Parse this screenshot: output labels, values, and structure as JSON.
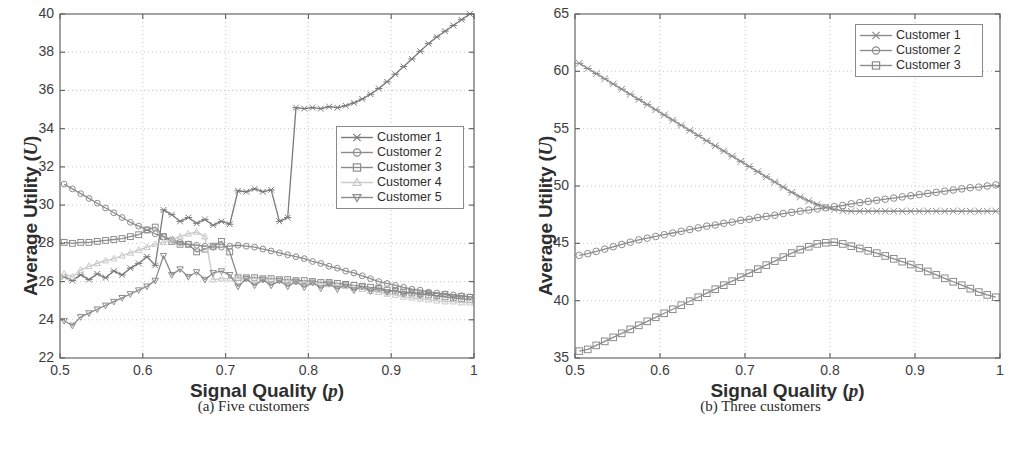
{
  "figure": {
    "background": "#ffffff",
    "panels": [
      {
        "id": "a",
        "caption": "(a) Five customers",
        "caption_label": "(a)",
        "caption_text": "Five customers"
      },
      {
        "id": "b",
        "caption": "(b) Three customers",
        "caption_label": "(b)",
        "caption_text": "Three customers"
      }
    ]
  },
  "axis_text": {
    "ylabel_prefix": "Average Utility (",
    "ylabel_symbol": "U",
    "ylabel_suffix": ")",
    "xlabel_prefix": "Signal Quality (",
    "xlabel_symbol": "p",
    "xlabel_suffix": ")"
  },
  "colors": {
    "series_dark": "#7a7a7a",
    "series_mid": "#8c8c8c",
    "series_light": "#c8c8c8",
    "axis": "#666666",
    "grid": "#b9b9b9",
    "text": "#2e2e2e",
    "background": "#ffffff"
  },
  "chart_data": [
    {
      "type": "line",
      "id": "five-customers",
      "title": "(a) Five customers",
      "xlabel": "Signal Quality (p)",
      "ylabel": "Average Utility (U)",
      "xlim": [
        0.5,
        1.0
      ],
      "ylim": [
        22,
        40
      ],
      "xticks": [
        0.5,
        0.6,
        0.7,
        0.8,
        0.9,
        1
      ],
      "xtick_labels": [
        "0.5",
        "0.6",
        "0.7",
        "0.8",
        "0.9",
        "1"
      ],
      "yticks": [
        22,
        24,
        26,
        28,
        30,
        32,
        34,
        36,
        38,
        40
      ],
      "ytick_labels": [
        "22",
        "24",
        "26",
        "28",
        "30",
        "32",
        "34",
        "36",
        "38",
        "40"
      ],
      "grid": true,
      "legend_position": "center-right",
      "legend": [
        "Customer 1",
        "Customer 2",
        "Customer 3",
        "Customer 4",
        "Customer 5"
      ],
      "markers": [
        "x-cross",
        "circle",
        "square",
        "triangle-up",
        "triangle-down"
      ],
      "x": [
        0.505,
        0.515,
        0.525,
        0.535,
        0.545,
        0.555,
        0.565,
        0.575,
        0.585,
        0.595,
        0.605,
        0.615,
        0.625,
        0.635,
        0.645,
        0.655,
        0.665,
        0.675,
        0.685,
        0.695,
        0.705,
        0.715,
        0.725,
        0.735,
        0.745,
        0.755,
        0.765,
        0.775,
        0.785,
        0.795,
        0.805,
        0.815,
        0.825,
        0.835,
        0.845,
        0.855,
        0.865,
        0.875,
        0.885,
        0.895,
        0.905,
        0.915,
        0.925,
        0.935,
        0.945,
        0.955,
        0.965,
        0.975,
        0.985,
        0.995
      ],
      "series": [
        {
          "name": "Customer 1",
          "marker": "x-cross",
          "color": "#7a7a7a",
          "values": [
            26.25,
            26.05,
            26.35,
            26.1,
            26.4,
            26.2,
            26.55,
            26.35,
            26.7,
            26.95,
            27.3,
            26.85,
            29.75,
            29.5,
            29.15,
            29.35,
            29.05,
            29.25,
            28.95,
            29.15,
            29.0,
            30.75,
            30.7,
            30.85,
            30.7,
            30.8,
            29.15,
            29.35,
            35.1,
            35.05,
            35.1,
            35.05,
            35.15,
            35.1,
            35.2,
            35.35,
            35.55,
            35.8,
            36.1,
            36.45,
            36.85,
            37.25,
            37.65,
            38.05,
            38.45,
            38.8,
            39.1,
            39.4,
            39.7,
            40.0
          ]
        },
        {
          "name": "Customer 2",
          "marker": "circle",
          "color": "#8c8c8c",
          "values": [
            31.1,
            30.85,
            30.6,
            30.35,
            30.1,
            29.85,
            29.6,
            29.35,
            29.1,
            28.9,
            28.7,
            28.5,
            28.35,
            28.2,
            28.05,
            27.95,
            27.9,
            27.85,
            27.8,
            27.8,
            27.85,
            27.9,
            27.85,
            27.8,
            27.7,
            27.6,
            27.5,
            27.4,
            27.3,
            27.2,
            27.05,
            26.95,
            26.8,
            26.7,
            26.55,
            26.45,
            26.3,
            26.15,
            26.0,
            25.9,
            25.8,
            25.7,
            25.6,
            25.55,
            25.45,
            25.4,
            25.35,
            25.3,
            25.25,
            25.2
          ]
        },
        {
          "name": "Customer 3",
          "marker": "square",
          "color": "#8c8c8c",
          "values": [
            28.05,
            28.0,
            28.05,
            28.05,
            28.1,
            28.15,
            28.2,
            28.25,
            28.35,
            28.45,
            28.7,
            28.85,
            28.35,
            28.1,
            27.95,
            27.95,
            27.55,
            27.7,
            27.85,
            28.1,
            27.55,
            26.2,
            26.2,
            26.2,
            26.15,
            26.15,
            26.1,
            26.1,
            26.05,
            26.05,
            26.0,
            25.95,
            25.95,
            25.9,
            25.85,
            25.8,
            25.75,
            25.7,
            25.65,
            25.55,
            25.5,
            25.45,
            25.4,
            25.35,
            25.3,
            25.25,
            25.2,
            25.15,
            25.1,
            25.05
          ]
        },
        {
          "name": "Customer 4",
          "marker": "triangle-up",
          "color": "#c8c8c8",
          "values": [
            26.4,
            26.25,
            26.6,
            26.8,
            26.95,
            27.1,
            27.2,
            27.35,
            27.5,
            27.65,
            27.8,
            27.95,
            28.05,
            28.2,
            28.35,
            28.5,
            28.6,
            28.35,
            26.1,
            26.15,
            26.15,
            26.2,
            26.2,
            26.15,
            26.15,
            26.1,
            26.1,
            26.05,
            26.0,
            25.95,
            25.95,
            25.9,
            25.85,
            25.8,
            25.75,
            25.65,
            25.6,
            25.5,
            25.45,
            25.35,
            25.3,
            25.2,
            25.15,
            25.1,
            25.05,
            25.0,
            24.95,
            24.95,
            24.9,
            24.9
          ]
        },
        {
          "name": "Customer 5",
          "marker": "triangle-down",
          "color": "#8c8c8c",
          "values": [
            23.95,
            23.7,
            24.15,
            24.35,
            24.55,
            24.75,
            24.95,
            25.15,
            25.35,
            25.55,
            25.75,
            26.05,
            27.35,
            26.35,
            26.65,
            26.25,
            26.5,
            26.1,
            26.45,
            26.55,
            26.35,
            25.75,
            26.15,
            25.8,
            26.1,
            25.8,
            26.05,
            25.75,
            26.0,
            25.7,
            25.95,
            25.65,
            25.9,
            25.6,
            25.85,
            25.55,
            25.75,
            25.5,
            25.65,
            25.45,
            25.55,
            25.35,
            25.45,
            25.3,
            25.4,
            25.25,
            25.35,
            25.2,
            25.25,
            25.2
          ]
        }
      ]
    },
    {
      "type": "line",
      "id": "three-customers",
      "title": "(b) Three customers",
      "xlabel": "Signal Quality (p)",
      "ylabel": "Average Utility (U)",
      "xlim": [
        0.5,
        1.0
      ],
      "ylim": [
        35,
        65
      ],
      "xticks": [
        0.5,
        0.6,
        0.7,
        0.8,
        0.9,
        1
      ],
      "xtick_labels": [
        "0.5",
        "0.6",
        "0.7",
        "0.8",
        "0.9",
        "1"
      ],
      "yticks": [
        35,
        40,
        45,
        50,
        55,
        60,
        65
      ],
      "ytick_labels": [
        "35",
        "40",
        "45",
        "50",
        "55",
        "60",
        "65"
      ],
      "grid": true,
      "legend_position": "top-right",
      "legend": [
        "Customer 1",
        "Customer 2",
        "Customer 3"
      ],
      "markers": [
        "x-cross",
        "circle",
        "square"
      ],
      "x": [
        0.505,
        0.515,
        0.525,
        0.535,
        0.545,
        0.555,
        0.565,
        0.575,
        0.585,
        0.595,
        0.605,
        0.615,
        0.625,
        0.635,
        0.645,
        0.655,
        0.665,
        0.675,
        0.685,
        0.695,
        0.705,
        0.715,
        0.725,
        0.735,
        0.745,
        0.755,
        0.765,
        0.775,
        0.785,
        0.795,
        0.805,
        0.815,
        0.825,
        0.835,
        0.845,
        0.855,
        0.865,
        0.875,
        0.885,
        0.895,
        0.905,
        0.915,
        0.925,
        0.935,
        0.945,
        0.955,
        0.965,
        0.975,
        0.985,
        0.995
      ],
      "series": [
        {
          "name": "Customer 1",
          "marker": "x-cross",
          "color": "#8c8c8c",
          "values": [
            60.7,
            60.25,
            59.8,
            59.35,
            58.9,
            58.45,
            58.0,
            57.55,
            57.1,
            56.65,
            56.2,
            55.75,
            55.3,
            54.85,
            54.4,
            53.95,
            53.5,
            53.05,
            52.6,
            52.15,
            51.7,
            51.25,
            50.8,
            50.35,
            49.9,
            49.45,
            49.05,
            48.7,
            48.4,
            48.15,
            47.95,
            47.85,
            47.8,
            47.8,
            47.8,
            47.8,
            47.8,
            47.8,
            47.8,
            47.8,
            47.8,
            47.8,
            47.8,
            47.8,
            47.8,
            47.8,
            47.8,
            47.8,
            47.8,
            47.8
          ]
        },
        {
          "name": "Customer 2",
          "marker": "circle",
          "color": "#8c8c8c",
          "values": [
            43.95,
            44.1,
            44.3,
            44.5,
            44.7,
            44.9,
            45.1,
            45.3,
            45.45,
            45.6,
            45.75,
            45.9,
            46.05,
            46.2,
            46.35,
            46.5,
            46.6,
            46.75,
            46.85,
            47.0,
            47.1,
            47.25,
            47.35,
            47.45,
            47.6,
            47.7,
            47.8,
            47.9,
            48.0,
            48.1,
            48.2,
            48.3,
            48.45,
            48.55,
            48.65,
            48.75,
            48.85,
            48.95,
            49.05,
            49.15,
            49.25,
            49.35,
            49.45,
            49.55,
            49.65,
            49.75,
            49.85,
            49.9,
            50.0,
            50.1
          ]
        },
        {
          "name": "Customer 3",
          "marker": "square",
          "color": "#8c8c8c",
          "values": [
            35.6,
            35.75,
            36.1,
            36.45,
            36.8,
            37.15,
            37.5,
            37.85,
            38.2,
            38.55,
            38.9,
            39.25,
            39.6,
            39.95,
            40.3,
            40.65,
            41.0,
            41.35,
            41.7,
            42.05,
            42.4,
            42.75,
            43.1,
            43.45,
            43.8,
            44.15,
            44.45,
            44.7,
            44.95,
            45.05,
            45.1,
            44.95,
            44.75,
            44.55,
            44.35,
            44.15,
            43.9,
            43.65,
            43.4,
            43.15,
            42.85,
            42.55,
            42.25,
            41.95,
            41.65,
            41.35,
            41.05,
            40.75,
            40.5,
            40.3
          ]
        }
      ]
    }
  ]
}
